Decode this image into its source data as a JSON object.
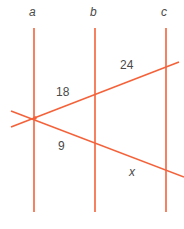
{
  "figure": {
    "background_color": "#ffffff",
    "line_color": "#F4623A",
    "label_color": "#4a4a4a",
    "width": 184,
    "height": 229
  },
  "parallel_lines": [
    {
      "name": "line-a",
      "label": "a",
      "x": 34,
      "y_top": 28,
      "y_bottom": 212,
      "label_x": 29,
      "label_y": 6
    },
    {
      "name": "line-b",
      "label": "b",
      "x": 95,
      "y_top": 28,
      "y_bottom": 212,
      "label_x": 90,
      "label_y": 6
    },
    {
      "name": "line-c",
      "label": "c",
      "x": 166,
      "y_top": 28,
      "y_bottom": 212,
      "label_x": 161,
      "label_y": 6
    }
  ],
  "transversals": [
    {
      "name": "upper-transversal",
      "x1": 11,
      "y1": 127,
      "x2": 179,
      "y2": 62
    },
    {
      "name": "lower-transversal",
      "x1": 11,
      "y1": 111,
      "x2": 184,
      "y2": 177
    }
  ],
  "vertex": {
    "x": 35,
    "y": 118
  },
  "segment_labels": [
    {
      "name": "segment-label-18",
      "text": "18",
      "x": 56,
      "y": 86,
      "italic": false
    },
    {
      "name": "segment-label-24",
      "text": "24",
      "x": 120,
      "y": 59,
      "italic": false
    },
    {
      "name": "segment-label-9",
      "text": "9",
      "x": 58,
      "y": 140,
      "italic": false
    },
    {
      "name": "segment-label-x",
      "text": "x",
      "x": 129,
      "y": 166,
      "italic": true
    }
  ]
}
